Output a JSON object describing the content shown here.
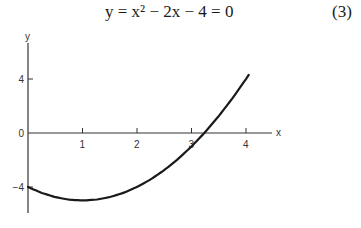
{
  "equation": {
    "text": "y = x² − 2x − 4 = 0",
    "number": "(3)"
  },
  "chart_data": {
    "type": "line",
    "title": "y = x² − 2x − 4 = 0",
    "xlabel": "x",
    "ylabel": "y",
    "x_ticks": [
      1,
      2,
      3,
      4
    ],
    "x_tick_labels": [
      "1",
      "2",
      "3",
      "4"
    ],
    "y_ticks": [
      4,
      0,
      -4
    ],
    "y_tick_labels": [
      "4",
      "0",
      "−4"
    ],
    "xlim": [
      0,
      4.5
    ],
    "ylim": [
      -6,
      6.5
    ],
    "grid": false,
    "legend": null,
    "series": [
      {
        "name": "y = x² − 2x − 4",
        "x": [
          0,
          0.25,
          0.5,
          0.75,
          1,
          1.25,
          1.5,
          1.75,
          2,
          2.25,
          2.5,
          2.75,
          3,
          3.25,
          3.5,
          3.75,
          4,
          4.05
        ],
        "y": [
          -4,
          -4.4375,
          -4.75,
          -4.9375,
          -5,
          -4.9375,
          -4.75,
          -4.4375,
          -4,
          -3.4375,
          -2.75,
          -1.9375,
          -1,
          0.0625,
          1.25,
          2.5625,
          4,
          4.3025
        ]
      }
    ],
    "annotations": [
      {
        "text": "(3)",
        "role": "equation number"
      }
    ]
  }
}
